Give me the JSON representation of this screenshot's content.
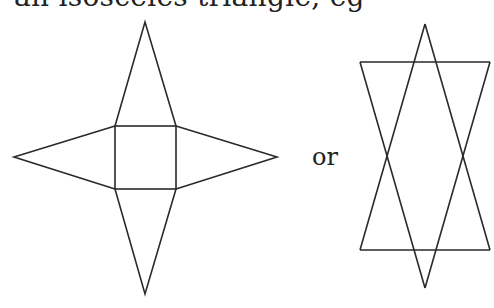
{
  "header": {
    "cropped_text": "an isosceles triangle, eg"
  },
  "connector": {
    "or_label": "or"
  },
  "figures": [
    {
      "name": "square-pyramid-net-star",
      "description": "Square base with four isosceles triangles attached to each side",
      "square": {
        "x1": 115,
        "y1": 126,
        "x2": 176,
        "y2": 189
      },
      "apexes": {
        "top": [
          145,
          22
        ],
        "bottom": [
          145,
          294
        ],
        "left": [
          14,
          157
        ],
        "right": [
          277,
          157
        ]
      }
    },
    {
      "name": "overlapping-triangles-net",
      "description": "Two overlapping isosceles triangles (upward and downward) within horizontal bands",
      "top_line_y": 62,
      "bottom_line_y": 250,
      "left_x": 360,
      "right_x": 490,
      "top_apex": [
        425,
        24
      ],
      "bottom_apex": [
        425,
        288
      ]
    }
  ],
  "colors": {
    "stroke": "#2a2a2a",
    "background": "#ffffff"
  }
}
